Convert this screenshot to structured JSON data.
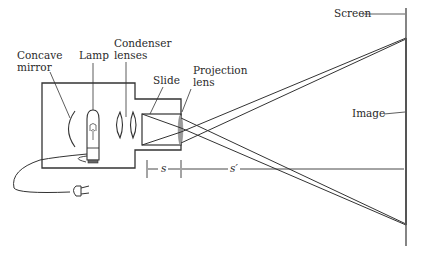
{
  "labels": {
    "concave_mirror_1": "Concave",
    "concave_mirror_2": "mirror",
    "lamp": "Lamp",
    "condenser_1": "Condenser",
    "condenser_2": "lenses",
    "slide": "Slide",
    "projection_1": "Projection",
    "projection_2": "lens",
    "screen": "Screen",
    "image": "Image",
    "object_distance": "s",
    "image_distance": "s′"
  },
  "colors": {
    "line": "#333333",
    "lens_fill": "#9a9a9a",
    "background": "#ffffff"
  }
}
